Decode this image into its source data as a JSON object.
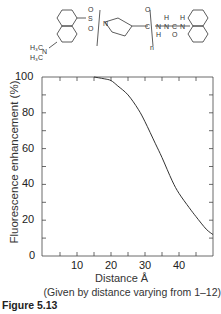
{
  "figure": {
    "label": "Figure 5.13",
    "caption": "(Given by distance varying from 1–12)",
    "structure": {
      "left_group": "H3C–N–H3C (dimethylamino-naphthalene)",
      "sulfonyl": "SO2",
      "repeat_unit": "proline",
      "repeat_index": "n",
      "labels": [
        "H3C",
        "N",
        "H3C",
        "S",
        "O",
        "O",
        "N",
        "C",
        "O",
        "N",
        "H",
        "N",
        "C",
        "O",
        "N",
        "H",
        "H",
        "n"
      ]
    }
  },
  "chart_data": {
    "type": "line",
    "title": "",
    "xlabel": "Distance Å",
    "ylabel": "Fluorescence enhancement (%)",
    "xlim": [
      0,
      50
    ],
    "ylim": [
      0,
      100
    ],
    "x_ticks": [
      10,
      20,
      30,
      40
    ],
    "y_ticks": [
      0,
      20,
      40,
      60,
      80,
      100
    ],
    "grid": false,
    "legend": null,
    "series": [
      {
        "name": "Fluorescence enhancement",
        "x": [
          15,
          18,
          20,
          22,
          25,
          28,
          30,
          33,
          35,
          38,
          40,
          43,
          45,
          48,
          50
        ],
        "y": [
          100,
          99,
          98,
          95,
          90,
          82,
          75,
          63,
          55,
          42,
          35,
          27,
          22,
          15,
          12
        ]
      }
    ]
  }
}
